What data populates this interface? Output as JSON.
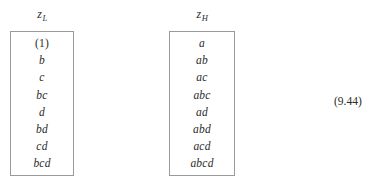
{
  "figure": {
    "equation_number": "(9.44)",
    "columns": [
      {
        "id": "z-low",
        "header_symbol": "z",
        "header_subscript": "L",
        "items": [
          {
            "text": "(1)",
            "style": "upright"
          },
          {
            "text": "b",
            "style": "italic"
          },
          {
            "text": "c",
            "style": "italic"
          },
          {
            "text": "bc",
            "style": "italic"
          },
          {
            "text": "d",
            "style": "italic"
          },
          {
            "text": "bd",
            "style": "italic"
          },
          {
            "text": "cd",
            "style": "italic"
          },
          {
            "text": "bcd",
            "style": "italic"
          }
        ]
      },
      {
        "id": "z-high",
        "header_symbol": "z",
        "header_subscript": "H",
        "items": [
          {
            "text": "a",
            "style": "italic"
          },
          {
            "text": "ab",
            "style": "italic"
          },
          {
            "text": "ac",
            "style": "italic"
          },
          {
            "text": "abc",
            "style": "italic"
          },
          {
            "text": "ad",
            "style": "italic"
          },
          {
            "text": "abd",
            "style": "italic"
          },
          {
            "text": "acd",
            "style": "italic"
          },
          {
            "text": "abcd",
            "style": "italic"
          }
        ]
      }
    ],
    "colors": {
      "background": "#ffffff",
      "text": "#2b2b2b",
      "border": "#9a9a9a"
    }
  }
}
